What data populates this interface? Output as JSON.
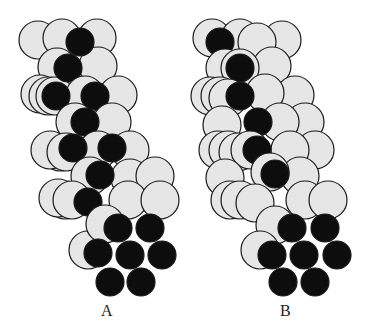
{
  "colors": {
    "background": "#ffffff",
    "light_atom_fill": "#e6e6e6",
    "dark_atom_fill": "#0d0d0d",
    "outline": "#1a1a1a"
  },
  "models": [
    {
      "id": "A",
      "label": "A",
      "atoms": [
        {
          "x": 38,
          "y": 40,
          "r": 19,
          "t": "l"
        },
        {
          "x": 97,
          "y": 38,
          "r": 19,
          "t": "l"
        },
        {
          "x": 62,
          "y": 38,
          "r": 19,
          "t": "l"
        },
        {
          "x": 57,
          "y": 67,
          "r": 19,
          "t": "l"
        },
        {
          "x": 40,
          "y": 94,
          "r": 19,
          "t": "l"
        },
        {
          "x": 48,
          "y": 96,
          "r": 19,
          "t": "l"
        },
        {
          "x": 98,
          "y": 66,
          "r": 19,
          "t": "l"
        },
        {
          "x": 118,
          "y": 95,
          "r": 19,
          "t": "l"
        },
        {
          "x": 55,
          "y": 96,
          "r": 19,
          "t": "l"
        },
        {
          "x": 80,
          "y": 42,
          "r": 14,
          "t": "d"
        },
        {
          "x": 68,
          "y": 68,
          "r": 14,
          "t": "d"
        },
        {
          "x": 85,
          "y": 95,
          "r": 19,
          "t": "l"
        },
        {
          "x": 56,
          "y": 96,
          "r": 14,
          "t": "d"
        },
        {
          "x": 95,
          "y": 96,
          "r": 14,
          "t": "d"
        },
        {
          "x": 60,
          "y": 152,
          "r": 19,
          "t": "l"
        },
        {
          "x": 50,
          "y": 150,
          "r": 19,
          "t": "l"
        },
        {
          "x": 75,
          "y": 122,
          "r": 19,
          "t": "l"
        },
        {
          "x": 112,
          "y": 122,
          "r": 19,
          "t": "l"
        },
        {
          "x": 130,
          "y": 150,
          "r": 19,
          "t": "l"
        },
        {
          "x": 85,
          "y": 122,
          "r": 14,
          "t": "d"
        },
        {
          "x": 66,
          "y": 152,
          "r": 19,
          "t": "l"
        },
        {
          "x": 98,
          "y": 150,
          "r": 19,
          "t": "l"
        },
        {
          "x": 73,
          "y": 148,
          "r": 14,
          "t": "d"
        },
        {
          "x": 112,
          "y": 148,
          "r": 14,
          "t": "d"
        },
        {
          "x": 65,
          "y": 200,
          "r": 19,
          "t": "l"
        },
        {
          "x": 58,
          "y": 198,
          "r": 19,
          "t": "l"
        },
        {
          "x": 90,
          "y": 176,
          "r": 19,
          "t": "l"
        },
        {
          "x": 130,
          "y": 178,
          "r": 19,
          "t": "l"
        },
        {
          "x": 155,
          "y": 176,
          "r": 19,
          "t": "l"
        },
        {
          "x": 100,
          "y": 175,
          "r": 14,
          "t": "d"
        },
        {
          "x": 72,
          "y": 200,
          "r": 19,
          "t": "l"
        },
        {
          "x": 128,
          "y": 200,
          "r": 19,
          "t": "l"
        },
        {
          "x": 160,
          "y": 200,
          "r": 19,
          "t": "l"
        },
        {
          "x": 88,
          "y": 202,
          "r": 14,
          "t": "d"
        },
        {
          "x": 88,
          "y": 250,
          "r": 19,
          "t": "l"
        },
        {
          "x": 105,
          "y": 224,
          "r": 19,
          "t": "l"
        },
        {
          "x": 118,
          "y": 228,
          "r": 14,
          "t": "d"
        },
        {
          "x": 150,
          "y": 228,
          "r": 14,
          "t": "d"
        },
        {
          "x": 98,
          "y": 253,
          "r": 14,
          "t": "d"
        },
        {
          "x": 130,
          "y": 255,
          "r": 14,
          "t": "d"
        },
        {
          "x": 162,
          "y": 255,
          "r": 14,
          "t": "d"
        },
        {
          "x": 110,
          "y": 282,
          "r": 14,
          "t": "d"
        },
        {
          "x": 141,
          "y": 282,
          "r": 14,
          "t": "d"
        }
      ]
    },
    {
      "id": "B",
      "label": "B",
      "atoms": [
        {
          "x": 212,
          "y": 38,
          "r": 19,
          "t": "l"
        },
        {
          "x": 240,
          "y": 38,
          "r": 19,
          "t": "l"
        },
        {
          "x": 282,
          "y": 40,
          "r": 19,
          "t": "l"
        },
        {
          "x": 257,
          "y": 42,
          "r": 19,
          "t": "l"
        },
        {
          "x": 220,
          "y": 42,
          "r": 14,
          "t": "d"
        },
        {
          "x": 225,
          "y": 68,
          "r": 19,
          "t": "l"
        },
        {
          "x": 272,
          "y": 66,
          "r": 19,
          "t": "l"
        },
        {
          "x": 240,
          "y": 68,
          "r": 19,
          "t": "l"
        },
        {
          "x": 240,
          "y": 68,
          "r": 14,
          "t": "d"
        },
        {
          "x": 210,
          "y": 96,
          "r": 19,
          "t": "l"
        },
        {
          "x": 220,
          "y": 96,
          "r": 19,
          "t": "l"
        },
        {
          "x": 228,
          "y": 98,
          "r": 19,
          "t": "l"
        },
        {
          "x": 295,
          "y": 95,
          "r": 19,
          "t": "l"
        },
        {
          "x": 265,
          "y": 93,
          "r": 19,
          "t": "l"
        },
        {
          "x": 240,
          "y": 96,
          "r": 14,
          "t": "d"
        },
        {
          "x": 222,
          "y": 125,
          "r": 19,
          "t": "l"
        },
        {
          "x": 305,
          "y": 122,
          "r": 19,
          "t": "l"
        },
        {
          "x": 280,
          "y": 122,
          "r": 19,
          "t": "l"
        },
        {
          "x": 258,
          "y": 122,
          "r": 14,
          "t": "d"
        },
        {
          "x": 218,
          "y": 150,
          "r": 19,
          "t": "l"
        },
        {
          "x": 228,
          "y": 150,
          "r": 19,
          "t": "l"
        },
        {
          "x": 238,
          "y": 152,
          "r": 19,
          "t": "l"
        },
        {
          "x": 315,
          "y": 150,
          "r": 19,
          "t": "l"
        },
        {
          "x": 290,
          "y": 150,
          "r": 19,
          "t": "l"
        },
        {
          "x": 250,
          "y": 150,
          "r": 19,
          "t": "l"
        },
        {
          "x": 257,
          "y": 150,
          "r": 14,
          "t": "d"
        },
        {
          "x": 225,
          "y": 178,
          "r": 19,
          "t": "l"
        },
        {
          "x": 300,
          "y": 176,
          "r": 19,
          "t": "l"
        },
        {
          "x": 270,
          "y": 172,
          "r": 19,
          "t": "l"
        },
        {
          "x": 275,
          "y": 174,
          "r": 14,
          "t": "d"
        },
        {
          "x": 230,
          "y": 200,
          "r": 19,
          "t": "l"
        },
        {
          "x": 240,
          "y": 200,
          "r": 19,
          "t": "l"
        },
        {
          "x": 255,
          "y": 203,
          "r": 19,
          "t": "l"
        },
        {
          "x": 305,
          "y": 200,
          "r": 19,
          "t": "l"
        },
        {
          "x": 328,
          "y": 200,
          "r": 19,
          "t": "l"
        },
        {
          "x": 275,
          "y": 225,
          "r": 19,
          "t": "l"
        },
        {
          "x": 260,
          "y": 250,
          "r": 19,
          "t": "l"
        },
        {
          "x": 292,
          "y": 228,
          "r": 14,
          "t": "d"
        },
        {
          "x": 325,
          "y": 228,
          "r": 14,
          "t": "d"
        },
        {
          "x": 272,
          "y": 255,
          "r": 14,
          "t": "d"
        },
        {
          "x": 304,
          "y": 255,
          "r": 14,
          "t": "d"
        },
        {
          "x": 337,
          "y": 255,
          "r": 14,
          "t": "d"
        },
        {
          "x": 283,
          "y": 282,
          "r": 14,
          "t": "d"
        },
        {
          "x": 315,
          "y": 282,
          "r": 14,
          "t": "d"
        }
      ]
    }
  ]
}
